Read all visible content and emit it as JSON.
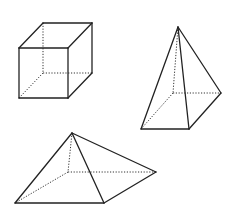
{
  "figure": {
    "width": 232,
    "height": 214,
    "background": "#ffffff",
    "line_color": "#222222",
    "shapes": [
      {
        "name": "cube",
        "solid_edges": [
          [
            [
              19,
              48
            ],
            [
              68,
              48
            ]
          ],
          [
            [
              68,
              48
            ],
            [
              68,
              98
            ]
          ],
          [
            [
              68,
              98
            ],
            [
              19,
              98
            ]
          ],
          [
            [
              19,
              98
            ],
            [
              19,
              48
            ]
          ],
          [
            [
              19,
              48
            ],
            [
              43,
              23
            ]
          ],
          [
            [
              43,
              23
            ],
            [
              92,
              23
            ]
          ],
          [
            [
              92,
              23
            ],
            [
              68,
              48
            ]
          ],
          [
            [
              92,
              23
            ],
            [
              92,
              73
            ]
          ],
          [
            [
              92,
              73
            ],
            [
              68,
              98
            ]
          ]
        ],
        "hidden_edges": [
          [
            [
              43,
              23
            ],
            [
              43,
              73
            ]
          ],
          [
            [
              43,
              73
            ],
            [
              92,
              73
            ]
          ],
          [
            [
              43,
              73
            ],
            [
              19,
              98
            ]
          ]
        ]
      },
      {
        "name": "tall-square-pyramid",
        "solid_edges": [
          [
            [
              178,
              27
            ],
            [
              141,
              129
            ]
          ],
          [
            [
              178,
              27
            ],
            [
              189,
              129
            ]
          ],
          [
            [
              178,
              27
            ],
            [
              221,
              93
            ]
          ],
          [
            [
              141,
              129
            ],
            [
              189,
              129
            ]
          ],
          [
            [
              189,
              129
            ],
            [
              221,
              93
            ]
          ]
        ],
        "hidden_edges": [
          [
            [
              178,
              27
            ],
            [
              173,
              93
            ]
          ],
          [
            [
              173,
              93
            ],
            [
              221,
              93
            ]
          ],
          [
            [
              173,
              93
            ],
            [
              141,
              129
            ]
          ]
        ]
      },
      {
        "name": "flat-square-pyramid",
        "solid_edges": [
          [
            [
              72,
              133
            ],
            [
              15,
              203
            ]
          ],
          [
            [
              72,
              133
            ],
            [
              104,
              203
            ]
          ],
          [
            [
              72,
              133
            ],
            [
              156,
              172
            ]
          ],
          [
            [
              15,
              203
            ],
            [
              104,
              203
            ]
          ],
          [
            [
              104,
              203
            ],
            [
              156,
              172
            ]
          ]
        ],
        "hidden_edges": [
          [
            [
              72,
              133
            ],
            [
              68,
              172
            ]
          ],
          [
            [
              68,
              172
            ],
            [
              156,
              172
            ]
          ],
          [
            [
              68,
              172
            ],
            [
              15,
              203
            ]
          ]
        ]
      }
    ]
  }
}
